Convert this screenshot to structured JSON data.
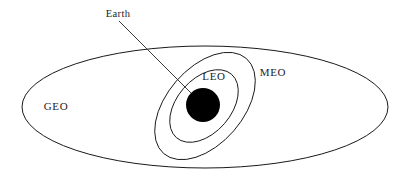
{
  "figure": {
    "background_color": "#ffffff",
    "stroke_color": "#1a1a1a",
    "earth_color": "#000000",
    "width": 408,
    "height": 182
  },
  "labels": {
    "earth": "Earth",
    "leo": "LEO",
    "meo": "MEO",
    "geo": "GEO"
  },
  "chart_data": {
    "type": "diagram",
    "elements": [
      {
        "name": "geo-orbit",
        "label": "GEO",
        "shape": "ellipse",
        "cx": 205,
        "cy": 107,
        "rx": 183,
        "ry": 61,
        "rotation": 0,
        "fill": "none",
        "stroke": "#1a1a1a"
      },
      {
        "name": "meo-orbit",
        "label": "MEO",
        "shape": "ellipse",
        "cx": 205,
        "cy": 106,
        "rx": 63,
        "ry": 38,
        "rotation": -49,
        "fill": "none",
        "stroke": "#1a1a1a"
      },
      {
        "name": "leo-orbit",
        "label": "LEO",
        "shape": "ellipse",
        "cx": 204,
        "cy": 106,
        "rx": 42,
        "ry": 27,
        "rotation": -49,
        "fill": "none",
        "stroke": "#1a1a1a"
      },
      {
        "name": "earth",
        "label": "Earth",
        "shape": "circle",
        "cx": 203,
        "cy": 105,
        "r": 17,
        "fill": "#000000",
        "stroke": "none"
      }
    ],
    "annotations": [
      {
        "name": "earth-leader",
        "text": "Earth",
        "text_x": 118,
        "text_y": 17,
        "line_from": [
          119,
          21
        ],
        "line_to": [
          199,
          101
        ]
      },
      {
        "name": "leo-label",
        "text": "LEO",
        "x": 214,
        "y": 80
      },
      {
        "name": "meo-label",
        "text": "MEO",
        "x": 273,
        "y": 76
      },
      {
        "name": "geo-label",
        "text": "GEO",
        "x": 56,
        "y": 110
      }
    ]
  }
}
